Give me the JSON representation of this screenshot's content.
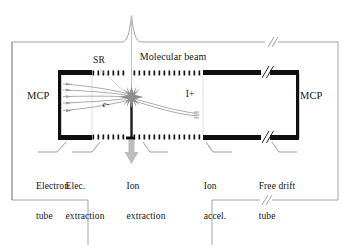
{
  "figure": {
    "type": "apparatus-schematic",
    "colors": {
      "background": "#ffffff",
      "chamber_wall": "#8a8a8a",
      "electrode_plate": "#101010",
      "grid_mesh": "#141414",
      "electron_trajectory": "#9a9a9a",
      "ion_trajectory": "#9f9f9f",
      "beam_axis": "#b5b5b5",
      "beam_arrow": "#b0b0b0",
      "text": "#151515",
      "leader_line": "#707070",
      "interaction_burst": "#8d8d8d"
    }
  },
  "detectors": {
    "left_label": "MCP",
    "right_label": "MCP"
  },
  "beams": {
    "molecular_beam_label": "Molecular beam",
    "synchrotron_radiation_label": "SR",
    "electron_label": "e-",
    "ion_label": "I+"
  },
  "regions": [
    {
      "id": "electron-tube",
      "line1": "Electron",
      "line2": "tube"
    },
    {
      "id": "elec-extraction",
      "line1": "Elec.",
      "line2": "extraction"
    },
    {
      "id": "ion-extraction",
      "line1": "Ion",
      "line2": "extraction"
    },
    {
      "id": "ion-accel",
      "line1": "Ion",
      "line2": "accel."
    },
    {
      "id": "free-drift-tube",
      "line1": "Free drift",
      "line2": "tube"
    }
  ],
  "break_marks": {
    "symbol": "//",
    "count": 4,
    "note": "double-slash breaks indicating truncated length on drift tube and chamber walls"
  }
}
